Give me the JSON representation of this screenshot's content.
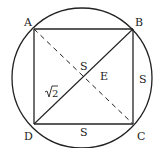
{
  "diagram": {
    "colors": {
      "stroke": "#222222",
      "background": "#ffffff"
    },
    "circle": {
      "cx": 82,
      "cy": 78,
      "r": 70
    },
    "vertices": {
      "A": {
        "label": "A",
        "x": 34,
        "y": 29
      },
      "B": {
        "label": "B",
        "x": 133,
        "y": 29
      },
      "C": {
        "label": "C",
        "x": 133,
        "y": 124
      },
      "D": {
        "label": "D",
        "x": 34,
        "y": 124
      }
    },
    "segments": [
      {
        "from": "A",
        "to": "B",
        "style": "solid"
      },
      {
        "from": "B",
        "to": "C",
        "style": "solid"
      },
      {
        "from": "C",
        "to": "D",
        "style": "solid"
      },
      {
        "from": "D",
        "to": "A",
        "style": "solid"
      },
      {
        "from": "D",
        "to": "B",
        "style": "solid"
      },
      {
        "from": "A",
        "to": "C",
        "style": "dashed"
      }
    ],
    "labels": {
      "center_point": "E",
      "side_top_half_diag": "S",
      "side_right": "S",
      "side_bottom": "S",
      "diagonal": "√2",
      "diagonal_radical": "√",
      "diagonal_value": "2"
    }
  }
}
